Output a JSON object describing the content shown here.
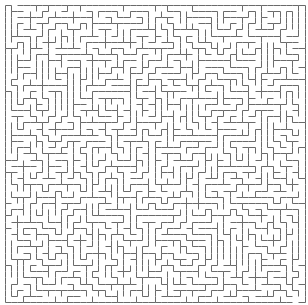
{
  "maze": {
    "width": 308,
    "height": 305,
    "origin_x": 4.5,
    "origin_y": 4.5,
    "cols": 48,
    "rows": 48,
    "cell_w": 6.25,
    "cell_h": 6.2,
    "wall_color": "#6a6a6a",
    "background_color": "#ffffff",
    "wall_width": 1,
    "seed": 20240517,
    "entrance": {
      "side": "top",
      "col": 1
    },
    "exit": {
      "side": "bottom",
      "col": 46
    }
  }
}
